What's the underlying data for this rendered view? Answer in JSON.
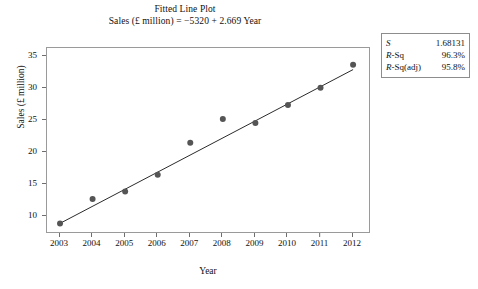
{
  "chart_data": {
    "type": "scatter",
    "title": "Fitted Line Plot",
    "subtitle": "Sales (£ million) = −5320 + 2.669 Year",
    "xlabel": "Year",
    "ylabel": "Sales (£ million)",
    "x": [
      2003,
      2004,
      2005,
      2006,
      2007,
      2008,
      2009,
      2010,
      2011,
      2012
    ],
    "values": [
      8.8,
      12.6,
      13.8,
      16.4,
      21.4,
      25.1,
      24.5,
      27.3,
      30.0,
      33.6
    ],
    "xtick_labels": [
      "2003",
      "2004",
      "2005",
      "2006",
      "2007",
      "2008",
      "2009",
      "2010",
      "2011",
      "2012"
    ],
    "ytick_labels": [
      "10",
      "15",
      "20",
      "25",
      "30",
      "35"
    ],
    "yticks": [
      10,
      15,
      20,
      25,
      30,
      35
    ],
    "xlim": [
      2002.6,
      2012.55
    ],
    "ylim": [
      7.15,
      36.2
    ],
    "grid": false,
    "legend": false,
    "fit_line": {
      "intercept": -5320,
      "slope": 2.669,
      "x_start": 2003,
      "x_end": 2012,
      "y_start": 8.81,
      "y_end": 32.83
    },
    "marker_color": "#555555",
    "line_color": "#2b2b2b",
    "frame_color": "#9a9a9a"
  },
  "stats": {
    "rows": [
      {
        "key": "S",
        "key_upright": "",
        "value": "1.68131"
      },
      {
        "key": "R",
        "key_upright": "-Sq",
        "value": "96.3%"
      },
      {
        "key": "R",
        "key_upright": "-Sq(adj)",
        "value": "95.8%"
      }
    ]
  }
}
